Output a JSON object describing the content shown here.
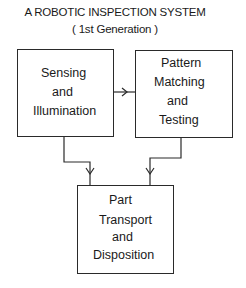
{
  "title": {
    "line1": "A ROBOTIC INSPECTION SYSTEM",
    "line2": "( 1st Generation )"
  },
  "nodes": [
    {
      "id": "sensing",
      "lines": [
        "Sensing",
        "and",
        "Illumination"
      ]
    },
    {
      "id": "pattern",
      "lines": [
        "Pattern",
        "Matching",
        "and",
        "Testing"
      ]
    },
    {
      "id": "transport",
      "lines": [
        "Part",
        "Transport",
        "and",
        "Disposition"
      ]
    }
  ],
  "edges": [
    {
      "from": "sensing",
      "to": "pattern"
    },
    {
      "from": "sensing",
      "to": "transport"
    },
    {
      "from": "pattern",
      "to": "transport"
    }
  ],
  "colors": {
    "line": "#2a2a2a",
    "text": "#1a1a1a",
    "background": "#ffffff"
  }
}
